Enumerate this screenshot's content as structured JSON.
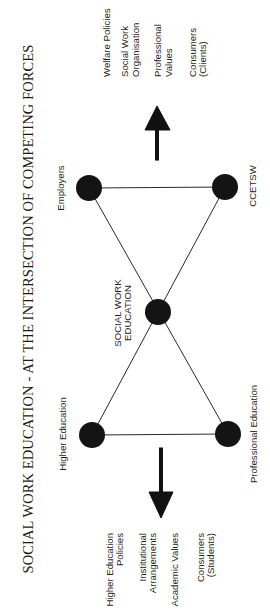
{
  "title": "SOCIAL WORK EDUCATION - AT THE INTERSECTION OF COMPETING FORCES",
  "nodes": {
    "center": {
      "label_line1": "SOCIAL WORK",
      "label_line2": "EDUCATION"
    },
    "higher_education": {
      "label": "Higher Education"
    },
    "professional_education": {
      "label": "Professional Education"
    },
    "employers": {
      "label": "Employers"
    },
    "ccetsw": {
      "label": "CCETSW"
    }
  },
  "left_forces": {
    "items": [
      {
        "line1": "Higher Education",
        "line2": "Policies"
      },
      {
        "line1": "Institutional",
        "line2": "Arrangements"
      },
      {
        "line1": "Academic Values",
        "line2": ""
      },
      {
        "line1": "Consumers",
        "line2": "(Students)"
      }
    ]
  },
  "right_forces": {
    "items": [
      {
        "line1": "Welfare Policies",
        "line2": ""
      },
      {
        "line1": "Social Work",
        "line2": "Organisation"
      },
      {
        "line1": "Professional",
        "line2": "Values"
      },
      {
        "line1": "Consumers",
        "line2": "(Clients)"
      }
    ]
  },
  "colors": {
    "node_fill": "#141414",
    "line": "#2a2a2a",
    "text": "#1f1f1f",
    "background": "#ffffff"
  }
}
